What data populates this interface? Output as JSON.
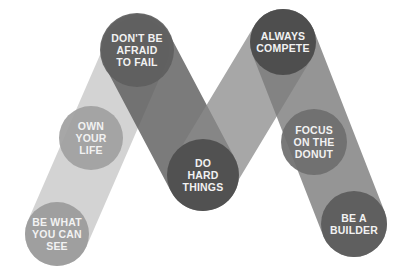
{
  "diagram": {
    "colors": {
      "background": "#ffffff",
      "band_light": "#bdbdbd",
      "band_dark": "#6a6a6a",
      "band_mid": "#8e8e8e",
      "text": "#f2f2f2"
    },
    "nodes": [
      {
        "id": "be-what-you-can-see",
        "lines": [
          "BE WHAT",
          "YOU CAN",
          "SEE"
        ],
        "cx": 57,
        "cy": 234,
        "r": 32,
        "fill": "#9a9a9a"
      },
      {
        "id": "own-your-life",
        "lines": [
          "OWN",
          "YOUR",
          "LIFE"
        ],
        "cx": 91,
        "cy": 138,
        "r": 32,
        "fill": "#a0a0a0"
      },
      {
        "id": "dont-be-afraid-to-fail",
        "lines": [
          "DON'T BE",
          "AFRAID",
          "TO FAIL"
        ],
        "cx": 137,
        "cy": 50,
        "r": 37,
        "fill": "#5e5e5e"
      },
      {
        "id": "do-hard-things",
        "lines": [
          "DO",
          "HARD",
          "THINGS"
        ],
        "cx": 203,
        "cy": 175,
        "r": 36,
        "fill": "#4d4d4d"
      },
      {
        "id": "always-compete",
        "lines": [
          "ALWAYS",
          "COMPETE"
        ],
        "cx": 283,
        "cy": 42,
        "r": 33,
        "fill": "#4a4a4a"
      },
      {
        "id": "focus-on-the-donut",
        "lines": [
          "FOCUS",
          "ON THE",
          "DONUT"
        ],
        "cx": 314,
        "cy": 142,
        "r": 33,
        "fill": "#6e6e6e"
      },
      {
        "id": "be-a-builder",
        "lines": [
          "BE A",
          "BUILDER"
        ],
        "cx": 354,
        "cy": 224,
        "r": 33,
        "fill": "#5a5a5a"
      }
    ],
    "bands": [
      {
        "from": 0,
        "to": 2,
        "width": 64,
        "fill": "#c4c4c4",
        "opacity": 0.75
      },
      {
        "from": 2,
        "to": 3,
        "width": 72,
        "fill": "#5a5a5a",
        "opacity": 0.8
      },
      {
        "from": 3,
        "to": 4,
        "width": 66,
        "fill": "#8a8a8a",
        "opacity": 0.75
      },
      {
        "from": 4,
        "to": 6,
        "width": 66,
        "fill": "#7a7a7a",
        "opacity": 0.8
      }
    ]
  }
}
